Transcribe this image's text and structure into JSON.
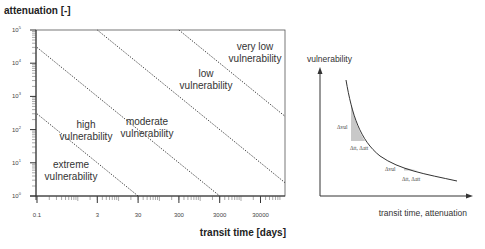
{
  "chart_data": [
    {
      "type": "line",
      "title": "",
      "ylabel": "attenuation [-]",
      "xlabel": "transit time [days]",
      "xscale": "log",
      "yscale": "log",
      "xlim": [
        0.1,
        120000
      ],
      "ylim": [
        1,
        100000
      ],
      "grid": false,
      "x_ticks": [
        "0.1",
        "3",
        "30",
        "300",
        "3000",
        "30000"
      ],
      "y_ticks": [
        "10^0",
        "10^1",
        "10^2",
        "10^3",
        "10^4",
        "10^5"
      ],
      "series": [
        {
          "name": "extreme/high boundary",
          "style": "dotted",
          "x": [
            0.1,
            30
          ],
          "y": [
            300,
            1
          ]
        },
        {
          "name": "high/moderate boundary",
          "style": "dotted",
          "x": [
            0.1,
            3000
          ],
          "y": [
            30000,
            1
          ]
        },
        {
          "name": "moderate/low boundary",
          "style": "dotted",
          "x": [
            3,
            120000
          ],
          "y": [
            100000,
            2.5
          ]
        },
        {
          "name": "low/very low boundary",
          "style": "dotted",
          "x": [
            300,
            120000
          ],
          "y": [
            100000,
            250
          ]
        }
      ],
      "annotations": [
        {
          "text": "extreme vulnerability",
          "region": "bottom-left"
        },
        {
          "text": "high vulnerability"
        },
        {
          "text": "moderate vulnerability"
        },
        {
          "text": "low vulnerability"
        },
        {
          "text": "very low vulnerability",
          "region": "top-right"
        }
      ]
    },
    {
      "type": "line",
      "title": "",
      "ylabel": "vulnerability",
      "xlabel": "transit time, attenuation",
      "series": [
        {
          "name": "vulnerability curve",
          "shape": "decreasing convex (hyperbolic)"
        }
      ],
      "annotations": [
        {
          "text": "Δvul",
          "position": "steep part"
        },
        {
          "text": "Δtt, Δatt",
          "position": "steep part"
        },
        {
          "text": "Δvul",
          "position": "flat part"
        },
        {
          "text": "Δtt, Δatt",
          "position": "flat part"
        }
      ]
    }
  ],
  "left_chart": {
    "ylabel": "attenuation [-]",
    "xlabel": "transit time [days]",
    "y_ticks": [
      {
        "base": "10",
        "exp": "5"
      },
      {
        "base": "10",
        "exp": "4"
      },
      {
        "base": "10",
        "exp": "3"
      },
      {
        "base": "10",
        "exp": "2"
      },
      {
        "base": "10",
        "exp": "1"
      },
      {
        "base": "10",
        "exp": "0"
      }
    ],
    "x_ticks": [
      "0.1",
      "3",
      "30",
      "300",
      "3000",
      "30000"
    ],
    "regions": {
      "very_low": [
        "very low",
        "vulnerability"
      ],
      "low": [
        "low",
        "vulnerability"
      ],
      "moderate": [
        "moderate",
        "vulnerability"
      ],
      "high": [
        "high",
        "vulnerability"
      ],
      "extreme": [
        "extreme",
        "vulnerability"
      ]
    }
  },
  "right_chart": {
    "ylabel": "vulnerability",
    "xlabel": "transit time, attenuation",
    "steep": {
      "dvul": "Δvul",
      "dx": "Δtt, Δatt"
    },
    "flat": {
      "dvul": "Δvul",
      "dx": "Δtt, Δatt"
    }
  }
}
